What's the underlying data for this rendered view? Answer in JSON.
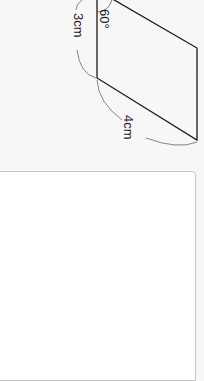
{
  "figure": {
    "shape": "parallelogram",
    "labels": {
      "side_short": "3cm",
      "side_long": "4cm",
      "angle": "60°"
    }
  },
  "answer_box": {
    "value": ""
  }
}
